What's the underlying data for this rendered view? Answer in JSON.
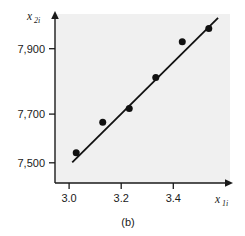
{
  "figure": {
    "caption": "(b)",
    "plot_background": "#f0f0f0",
    "ink_color": "#1a1a1a"
  },
  "chart_data": {
    "type": "scatter",
    "title": "",
    "subtitle": "",
    "caption": "(b)",
    "xlabel": "x1i",
    "ylabel": "x2i",
    "xlabel_base": "x",
    "xlabel_sub": "1i",
    "ylabel_base": "x",
    "ylabel_sub": "2i",
    "x": [
      3.0,
      3.1,
      3.2,
      3.3,
      3.4,
      3.5
    ],
    "values": [
      7505,
      7620,
      7672,
      7790,
      7925,
      7975
    ],
    "points": [
      {
        "x": 3.0,
        "y": 7505
      },
      {
        "x": 3.1,
        "y": 7620
      },
      {
        "x": 3.2,
        "y": 7672
      },
      {
        "x": 3.3,
        "y": 7790
      },
      {
        "x": 3.4,
        "y": 7925
      },
      {
        "x": 3.5,
        "y": 7975
      }
    ],
    "xticks": [
      3.0,
      3.2,
      3.4
    ],
    "xtick_labels": [
      "3.0",
      "3.2",
      "3.4"
    ],
    "yticks": [
      7500,
      7700,
      7900
    ],
    "ytick_labels": [
      "7,500",
      "7,700",
      "7,900"
    ],
    "xlim": [
      2.92,
      3.58
    ],
    "ylim": [
      7390,
      8030
    ],
    "grid": false,
    "legend": null,
    "marker": "filled-circle",
    "marker_color": "#111111",
    "fit_line": {
      "type": "linear",
      "color": "#111111",
      "x_start": 2.985,
      "y_start": 7468,
      "x_end": 3.535,
      "y_end": 8015
    }
  }
}
